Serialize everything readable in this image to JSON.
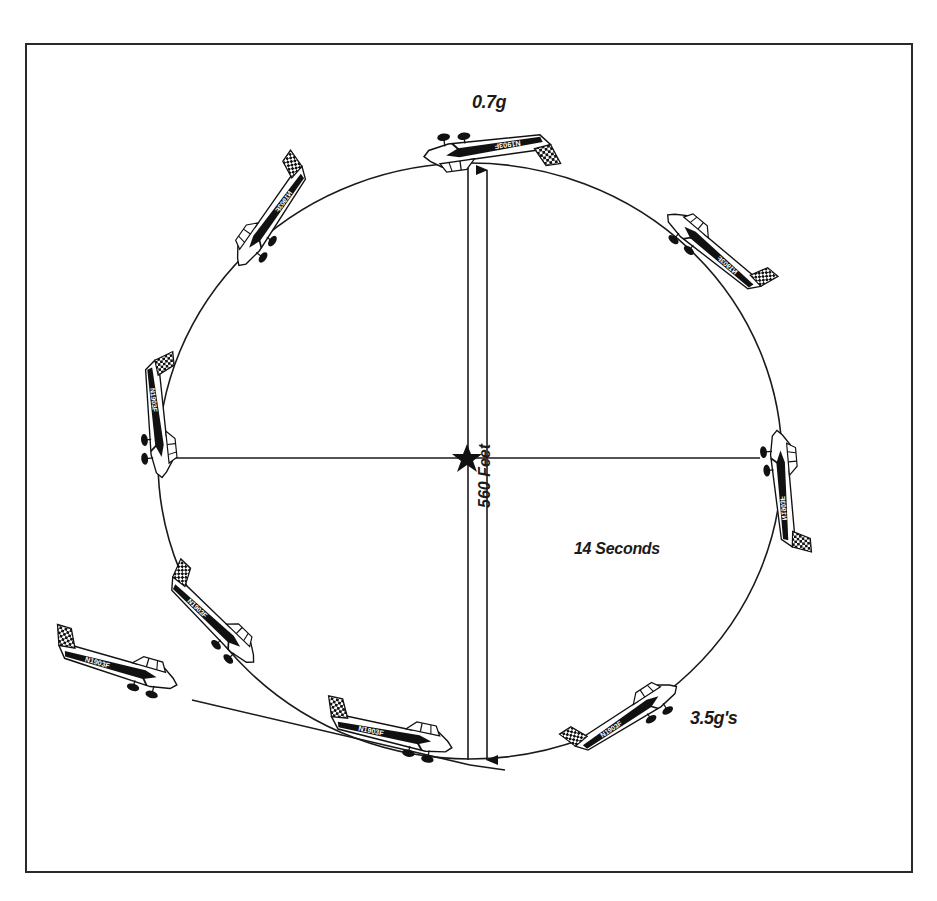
{
  "diagram": {
    "type": "loop-maneuver",
    "labels": {
      "top_load": "0.7g",
      "duration": "14 Seconds",
      "bottom_load": "3.5g's",
      "diameter": "560 Feet"
    },
    "aircraft_registration": "N1903F",
    "aircraft_count": 10,
    "colors": {
      "ink": "#1a1a1a",
      "background": "#ffffff",
      "frame": "#2a2a2a"
    }
  }
}
